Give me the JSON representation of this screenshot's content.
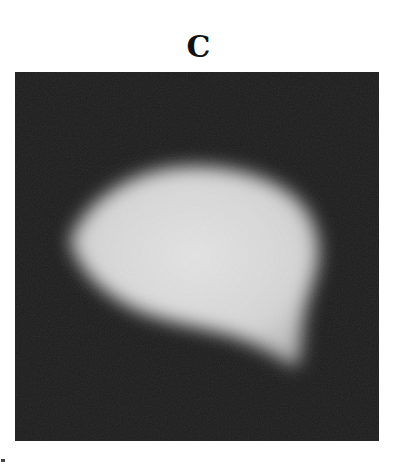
{
  "figure": {
    "panel_label": "C",
    "image": {
      "description": "grayscale micrograph of bright rounded-triangular blob on dark background",
      "background_color": "#1c1c1c",
      "blob_color": "#e2e2e2"
    }
  }
}
